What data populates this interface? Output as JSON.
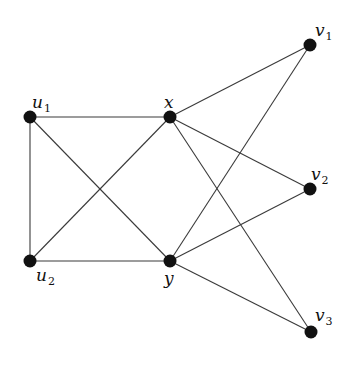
{
  "diagram": {
    "type": "graph",
    "nodes": [
      {
        "id": "u1",
        "base": "u",
        "sub": "1",
        "x": 30,
        "y": 117,
        "lx": 32,
        "ly": 108,
        "label": "u1"
      },
      {
        "id": "u2",
        "base": "u",
        "sub": "2",
        "x": 30,
        "y": 261,
        "lx": 36,
        "ly": 281,
        "label": "u2"
      },
      {
        "id": "x",
        "base": "x",
        "sub": "",
        "x": 170,
        "y": 117,
        "lx": 164,
        "ly": 108,
        "label": "x"
      },
      {
        "id": "y",
        "base": "y",
        "sub": "",
        "x": 170,
        "y": 261,
        "lx": 164,
        "ly": 284,
        "label": "y"
      },
      {
        "id": "v1",
        "base": "v",
        "sub": "1",
        "x": 310,
        "y": 45,
        "lx": 315,
        "ly": 36,
        "label": "v1"
      },
      {
        "id": "v2",
        "base": "v",
        "sub": "2",
        "x": 310,
        "y": 189,
        "lx": 311,
        "ly": 180,
        "label": "v2"
      },
      {
        "id": "v3",
        "base": "v",
        "sub": "3",
        "x": 311,
        "y": 332,
        "lx": 315,
        "ly": 321,
        "label": "v3"
      }
    ],
    "edges": [
      [
        "u1",
        "x"
      ],
      [
        "u1",
        "u2"
      ],
      [
        "u1",
        "y"
      ],
      [
        "u2",
        "x"
      ],
      [
        "u2",
        "y"
      ],
      [
        "x",
        "v1"
      ],
      [
        "x",
        "v2"
      ],
      [
        "x",
        "v3"
      ],
      [
        "y",
        "v1"
      ],
      [
        "y",
        "v2"
      ],
      [
        "y",
        "v3"
      ]
    ],
    "node_radius": 6.5,
    "colors": {
      "node": "#111111",
      "edge": "#3a3a3a",
      "background": "#ffffff"
    }
  }
}
